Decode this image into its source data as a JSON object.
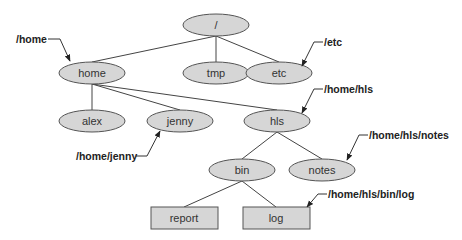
{
  "diagram": {
    "nodes": [
      {
        "id": "root",
        "label": "/",
        "shape": "ellipse",
        "cx": 216,
        "cy": 25
      },
      {
        "id": "home",
        "label": "home",
        "shape": "ellipse",
        "cx": 92,
        "cy": 73
      },
      {
        "id": "tmp",
        "label": "tmp",
        "shape": "ellipse",
        "cx": 216,
        "cy": 73
      },
      {
        "id": "etc",
        "label": "etc",
        "shape": "ellipse",
        "cx": 279,
        "cy": 73
      },
      {
        "id": "alex",
        "label": "alex",
        "shape": "ellipse",
        "cx": 92,
        "cy": 121
      },
      {
        "id": "jenny",
        "label": "jenny",
        "shape": "ellipse",
        "cx": 180,
        "cy": 121
      },
      {
        "id": "hls",
        "label": "hls",
        "shape": "ellipse",
        "cx": 277,
        "cy": 121
      },
      {
        "id": "bin",
        "label": "bin",
        "shape": "ellipse",
        "cx": 242,
        "cy": 170
      },
      {
        "id": "notes",
        "label": "notes",
        "shape": "ellipse",
        "cx": 322,
        "cy": 170
      },
      {
        "id": "report",
        "label": "report",
        "shape": "rect",
        "cx": 184,
        "cy": 218
      },
      {
        "id": "log",
        "label": "log",
        "shape": "rect",
        "cx": 276,
        "cy": 218
      }
    ],
    "edges": [
      [
        "root",
        "home"
      ],
      [
        "root",
        "tmp"
      ],
      [
        "root",
        "etc"
      ],
      [
        "home",
        "alex"
      ],
      [
        "home",
        "jenny"
      ],
      [
        "home",
        "hls"
      ],
      [
        "hls",
        "bin"
      ],
      [
        "hls",
        "notes"
      ],
      [
        "bin",
        "report"
      ],
      [
        "bin",
        "log"
      ]
    ],
    "path_labels": [
      {
        "id": "lbl-home",
        "text": "/home"
      },
      {
        "id": "lbl-etc",
        "text": "/etc"
      },
      {
        "id": "lbl-hls",
        "text": "/home/hls"
      },
      {
        "id": "lbl-jenny",
        "text": "/home/jenny"
      },
      {
        "id": "lbl-notes",
        "text": "/home/hls/notes"
      },
      {
        "id": "lbl-log",
        "text": "/home/hls/bin/log"
      }
    ],
    "colors": {
      "node_fill": "#d6d6d6",
      "node_stroke": "#555555",
      "edge": "#444444",
      "label_text": "#222222"
    }
  }
}
